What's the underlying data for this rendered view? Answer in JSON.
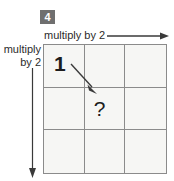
{
  "exercise": {
    "number": "4"
  },
  "axes": {
    "top": {
      "label": "multiply by 2",
      "arrow": "arrow-right",
      "direction": "right"
    },
    "left": {
      "label_line1": "multiply",
      "label_line2": "by 2",
      "arrow": "arrow-down",
      "direction": "down"
    }
  },
  "grid": {
    "rows": 3,
    "cols": 3,
    "cells": [
      [
        {
          "value": "1",
          "kind": "given"
        },
        {
          "value": "",
          "kind": "empty"
        },
        {
          "value": "",
          "kind": "empty"
        }
      ],
      [
        {
          "value": "",
          "kind": "empty"
        },
        {
          "value": "?",
          "kind": "unknown"
        },
        {
          "value": "",
          "kind": "empty"
        }
      ],
      [
        {
          "value": "",
          "kind": "empty"
        },
        {
          "value": "",
          "kind": "empty"
        },
        {
          "value": "",
          "kind": "empty"
        }
      ]
    ]
  },
  "annotation": {
    "diagonal_arrow": "arrow-diagonal-down-right",
    "from_cell": "row1-col1",
    "to_cell": "row2-col2"
  },
  "colors": {
    "badge_bg": "#6f6f6f",
    "badge_text": "#ffffff",
    "grid_line": "#8b8b8b",
    "cell_bg": "#f6f6f4",
    "text": "#2b2b2b",
    "arrow": "#3a3a3a",
    "page_bg": "#ffffff"
  }
}
